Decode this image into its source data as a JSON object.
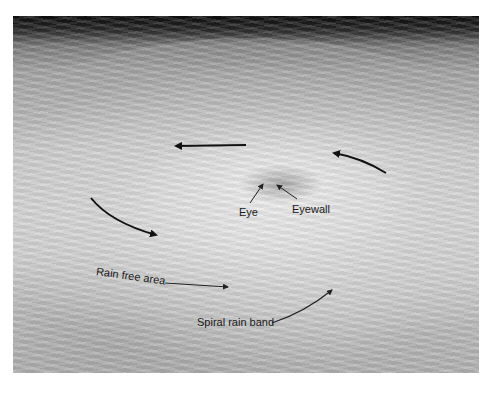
{
  "figure": {
    "labels": {
      "eye": "Eye",
      "eyewall": "Eyewall",
      "rain_free_area": "Rain free area",
      "spiral_rain_band": "Spiral rain band"
    },
    "arrows": [
      "rotation-arrow-top-left",
      "rotation-arrow-top-right",
      "rotation-arrow-left",
      "rotation-arrow-bottom-right"
    ],
    "colors": {
      "space": "#0e0e0e",
      "cloud": "#d4d4d4",
      "arrow": "#111111",
      "label_text": "#1a1a1a"
    }
  }
}
